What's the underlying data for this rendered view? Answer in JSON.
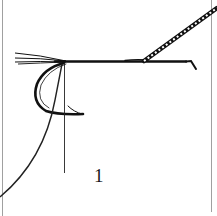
{
  "figure": {
    "step_label": "1",
    "colors": {
      "ink": "#111111",
      "border": "#9a9a9a",
      "background": "#ffffff"
    }
  }
}
